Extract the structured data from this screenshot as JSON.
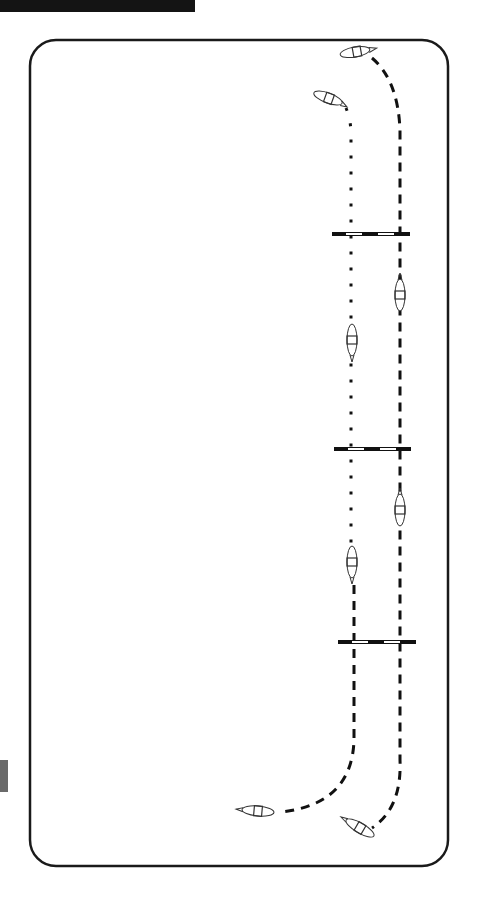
{
  "diagram": {
    "type": "arena-riding-pattern",
    "colors": {
      "outline": "#1a1a1a",
      "pole_dark": "#111111",
      "pole_light": "#ffffff",
      "header_bar": "#141414",
      "side_tab": "#6a6a6a"
    },
    "arena": {
      "x": 30,
      "y": 40,
      "width": 418,
      "height": 826,
      "corner_radius": 26
    },
    "poles": [
      {
        "id": "pole-set-1",
        "y": 234,
        "x1": 332,
        "x2": 410
      },
      {
        "id": "pole-set-2",
        "y": 449,
        "x1": 334,
        "x2": 411
      },
      {
        "id": "pole-set-3",
        "y": 642,
        "x1": 338,
        "x2": 416
      }
    ],
    "tracks": [
      {
        "id": "track-left",
        "style": "dotted-then-dashed",
        "x": 351
      },
      {
        "id": "track-right",
        "style": "dashed",
        "x": 400
      }
    ],
    "horses": [
      {
        "id": "horse-top-right",
        "x": 355,
        "y": 52,
        "heading": "right"
      },
      {
        "id": "horse-top-left",
        "x": 325,
        "y": 97,
        "heading": "right-down"
      },
      {
        "id": "horse-mid-right-1",
        "x": 400,
        "y": 295,
        "heading": "up"
      },
      {
        "id": "horse-mid-left-1",
        "x": 352,
        "y": 340,
        "heading": "down"
      },
      {
        "id": "horse-mid-right-2",
        "x": 400,
        "y": 510,
        "heading": "up"
      },
      {
        "id": "horse-mid-left-2",
        "x": 352,
        "y": 560,
        "heading": "down"
      },
      {
        "id": "horse-bottom-left",
        "x": 258,
        "y": 810,
        "heading": "left"
      },
      {
        "id": "horse-bottom-right",
        "x": 362,
        "y": 827,
        "heading": "left-up"
      }
    ]
  }
}
